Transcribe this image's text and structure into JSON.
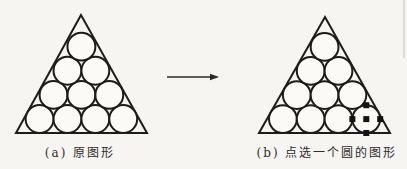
{
  "canvas": {
    "width": 407,
    "height": 169,
    "background": "#f6f5f2",
    "paper_fill": "#fbfaf7",
    "stroke_color": "#1d1c1a",
    "stroke_width": 2,
    "artifact_line": {
      "x": 404,
      "y1": 0,
      "y2": 58,
      "color": "#dbdad4"
    }
  },
  "arrow": {
    "x1": 167,
    "x2": 219,
    "y": 77,
    "head_length": 9,
    "head_half_width": 3.2,
    "color": "#2b2a28"
  },
  "figures": [
    {
      "id": "a",
      "caption": "(a) 原图形",
      "triangle": {
        "apex_x": 81,
        "apex_y": 15,
        "base_x1": 16,
        "base_x2": 147,
        "base_y": 133
      },
      "circle_rows": [
        4,
        3,
        2,
        1
      ],
      "selected": null
    },
    {
      "id": "b",
      "caption": "(b) 点选一个圆的图形",
      "triangle": {
        "apex_x": 325,
        "apex_y": 17,
        "base_x1": 259,
        "base_x2": 390,
        "base_y": 133
      },
      "circle_rows": [
        4,
        3,
        2,
        1
      ],
      "selected": {
        "row": 0,
        "index": 3
      }
    }
  ],
  "selection": {
    "handle_size": 6,
    "handle_color": "#141312",
    "handle_positions": [
      "center",
      "top",
      "bottom",
      "left",
      "right"
    ]
  }
}
